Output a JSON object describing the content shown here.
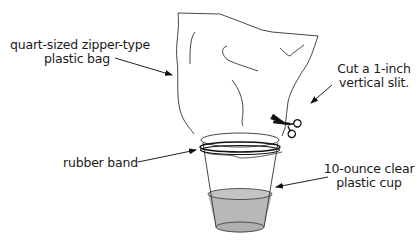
{
  "diagram": {
    "type": "labeled-apparatus-illustration",
    "colors": {
      "line": "#222222",
      "water_fill": "#b8b8b8",
      "background": "#ffffff"
    },
    "labels": {
      "bag_line1": "quart-sized zipper-type",
      "bag_line2": "plastic bag",
      "slit_line1": "Cut a 1-inch",
      "slit_line2": "vertical slit.",
      "band": "rubber band",
      "cup_line1": "10-ounce clear",
      "cup_line2": "plastic cup"
    },
    "icons": {
      "scissors": "scissors-icon"
    }
  }
}
